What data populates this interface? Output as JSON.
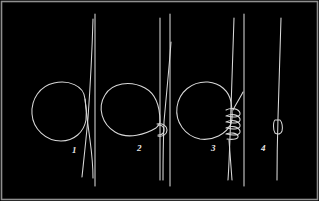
{
  "figure": {
    "title": "Fishing knot tying sequence",
    "description": "Four-step line drawing showing how a loop knot is tied: form a loop, pass the tag end through, wrap coils around the standing line, then draw tight.",
    "background_color": "#000000",
    "line_color": "#d8d8d8",
    "border_color": "#8f8f8f",
    "label_color": "#e8e8e8",
    "width": 319,
    "height": 201,
    "panel_count": 4
  },
  "steps": [
    {
      "number": "1",
      "name": "form-loop",
      "caption": "Form a loop with the tag end crossing the standing line",
      "label_x": 72,
      "label_y": 146
    },
    {
      "number": "2",
      "name": "pass-tag-end-through",
      "caption": "Pass the tag end through to create a small hook at the crossing",
      "label_x": 137,
      "label_y": 144
    },
    {
      "number": "3",
      "name": "wrap-coils",
      "caption": "Wrap the tag end around the standing line in five coils",
      "label_x": 211,
      "label_y": 144
    },
    {
      "number": "4",
      "name": "draw-tight",
      "caption": "Draw the knot tight against the standing line",
      "label_x": 261,
      "label_y": 144
    }
  ],
  "panel_dividers": [
    {
      "name": "divider-1",
      "x": 95
    },
    {
      "name": "divider-2",
      "x": 170
    },
    {
      "name": "divider-3",
      "x": 244
    }
  ]
}
